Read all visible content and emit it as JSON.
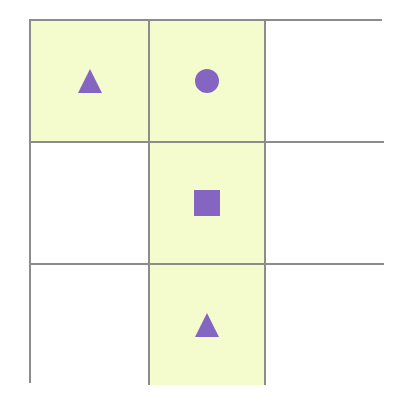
{
  "grid": {
    "rows": 3,
    "cols": 3,
    "colors": {
      "line": "#8c8c8c",
      "highlight": "#f4fbcc",
      "empty": "#ffffff",
      "shape": "#8466c2"
    },
    "cells": [
      {
        "row": 0,
        "col": 0,
        "highlighted": true,
        "shape": "triangle"
      },
      {
        "row": 0,
        "col": 1,
        "highlighted": true,
        "shape": "circle"
      },
      {
        "row": 0,
        "col": 2,
        "highlighted": false,
        "shape": null
      },
      {
        "row": 1,
        "col": 0,
        "highlighted": false,
        "shape": null
      },
      {
        "row": 1,
        "col": 1,
        "highlighted": true,
        "shape": "square"
      },
      {
        "row": 1,
        "col": 2,
        "highlighted": false,
        "shape": null
      },
      {
        "row": 2,
        "col": 0,
        "highlighted": false,
        "shape": null
      },
      {
        "row": 2,
        "col": 1,
        "highlighted": true,
        "shape": "triangle"
      },
      {
        "row": 2,
        "col": 2,
        "highlighted": false,
        "shape": null
      }
    ]
  }
}
